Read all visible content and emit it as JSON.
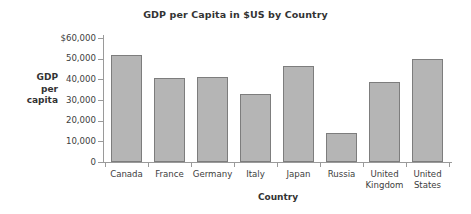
{
  "chart_data": {
    "type": "bar",
    "title": "GDP per Capita in $US by Country",
    "xlabel": "Country",
    "ylabel_lines": [
      "GDP",
      "per",
      "capita"
    ],
    "ylabel": "GDP per capita",
    "categories": [
      "Canada",
      "France",
      "Germany",
      "Italy",
      "Japan",
      "Russia",
      "United Kingdom",
      "United States"
    ],
    "category_lines": [
      [
        "Canada"
      ],
      [
        "France"
      ],
      [
        "Germany"
      ],
      [
        "Italy"
      ],
      [
        "Japan"
      ],
      [
        "Russia"
      ],
      [
        "United",
        "Kingdom"
      ],
      [
        "United",
        "States"
      ]
    ],
    "values": [
      51800,
      40500,
      41000,
      33000,
      46500,
      13800,
      38500,
      49700
    ],
    "ylim": [
      0,
      60000
    ],
    "ytick_values": [
      60000,
      50000,
      40000,
      30000,
      20000,
      10000,
      0
    ],
    "ytick_labels": [
      "$60,000",
      "50,000",
      "40,000",
      "30,000",
      "20,000",
      "10,000",
      "0"
    ],
    "grid": false,
    "legend": false,
    "bar_fill_color": "#b5b5b5",
    "bar_border_color": "#7d7d7d",
    "axis_color": "#9a9a9a",
    "text_color": "#3d3d3d",
    "background_color": "#ffffff"
  }
}
